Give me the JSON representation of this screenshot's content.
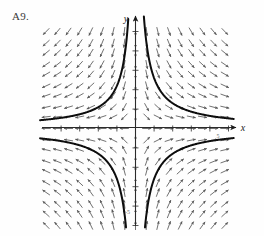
{
  "figure": {
    "label": "A9.",
    "caption": ""
  },
  "axes": {
    "x_label": "x",
    "y_label": "y",
    "origin_px": [
      135,
      128
    ],
    "x_range": [
      -5,
      5
    ],
    "y_range": [
      -5,
      5
    ],
    "x_tick_labels": [
      "-5",
      "5"
    ],
    "y_tick_labels": [
      "5",
      "-5"
    ],
    "tick_step": 1,
    "arrowheads": [
      "x-positive",
      "y-positive"
    ]
  },
  "colors": {
    "ink": "#1a1a1a",
    "arrow": "#4a4a4a",
    "curve": "#0d0d0d",
    "axis": "#2b2b2b",
    "label": "#3a3a3a",
    "background": "#fefefe"
  },
  "chart_data": {
    "type": "scatter",
    "title": "",
    "subtitle": "",
    "xlabel": "x",
    "ylabel": "y",
    "xlim": [
      -5.2,
      5.2
    ],
    "ylim": [
      -5.2,
      5.2
    ],
    "grid": false,
    "legend": "none",
    "plot_kind": "direction-field",
    "field": {
      "slope_formula": "dy/dx = -y/x",
      "grid_nx": 17,
      "grid_ny": 19,
      "x_samples": [
        -4.8,
        -4.2,
        -3.6,
        -3.0,
        -2.4,
        -1.8,
        -1.2,
        -0.6,
        0.0,
        0.6,
        1.2,
        1.8,
        2.4,
        3.0,
        3.6,
        4.2,
        4.8
      ],
      "y_samples": [
        -5.0,
        -4.4,
        -3.9,
        -3.3,
        -2.8,
        -2.2,
        -1.7,
        -1.1,
        -0.6,
        0.0,
        0.6,
        1.1,
        1.7,
        2.2,
        2.8,
        3.3,
        3.9,
        4.4,
        5.0
      ],
      "arrow_len_px": 9,
      "note": "Arrows point toward the origin along the vertical-ish (stable) direction and away from the origin along the horizontal (unstable) direction."
    },
    "separatrices": [
      {
        "name": "unstable-manifold",
        "axis": "x-axis",
        "direction": "outward"
      },
      {
        "name": "stable-manifold",
        "axis": "y-axis",
        "direction": "inward"
      }
    ],
    "solution_curves": [
      {
        "name": "curve-quadrant-II",
        "equation": "x*y = -2.2",
        "quadrant": 2
      },
      {
        "name": "curve-quadrant-I",
        "equation": "x*y = 2.6",
        "quadrant": 1
      },
      {
        "name": "curve-quadrant-III",
        "equation": "x*y = 2.6",
        "quadrant": 3
      },
      {
        "name": "curve-quadrant-IV",
        "equation": "x*y = -2.6",
        "quadrant": 4
      }
    ]
  }
}
